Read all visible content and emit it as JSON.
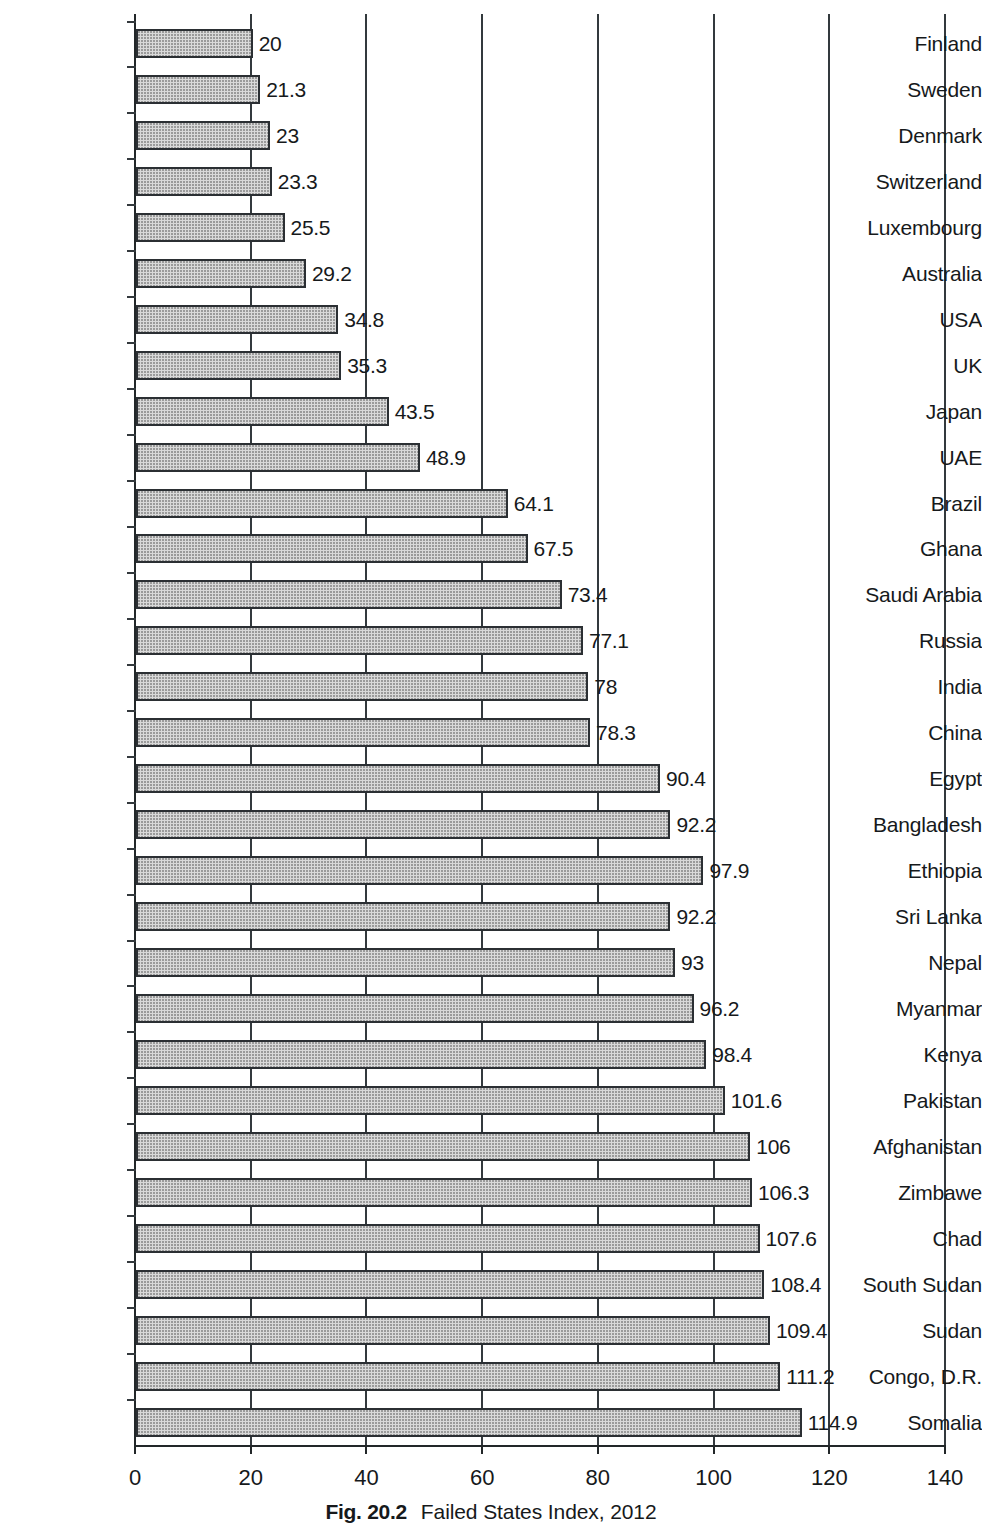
{
  "caption": {
    "figure_number": "Fig. 20.2",
    "text": "Failed States Index, 2012"
  },
  "chart_data": {
    "type": "bar",
    "orientation": "horizontal",
    "title": "Failed States Index, 2012",
    "xlabel": "",
    "ylabel": "",
    "xlim": [
      0,
      140
    ],
    "ylim": null,
    "grid": true,
    "grid_axis": "x",
    "legend": false,
    "legend_position": "none",
    "xticks": [
      0,
      20,
      40,
      60,
      80,
      100,
      120,
      140
    ],
    "xtick_labels": [
      "0",
      "20",
      "40",
      "60",
      "80",
      "100",
      "120",
      "140"
    ],
    "bar_fill_color": "#d9d9d9",
    "bar_edge_color": "#2b2f33",
    "categories": [
      "Finland",
      "Sweden",
      "Denmark",
      "Switzerland",
      "Luxembourg",
      "Australia",
      "USA",
      "UK",
      "Japan",
      "UAE",
      "Brazil",
      "Ghana",
      "Saudi Arabia",
      "Russia",
      "India",
      "China",
      "Egypt",
      "Bangladesh",
      "Ethiopia",
      "Sri Lanka",
      "Nepal",
      "Myanmar",
      "Kenya",
      "Pakistan",
      "Afghanistan",
      "Zimbawe",
      "Chad",
      "South Sudan",
      "Sudan",
      "Congo, D.R.",
      "Somalia"
    ],
    "values": [
      20,
      21.3,
      23,
      23.3,
      25.5,
      29.2,
      34.8,
      35.3,
      43.5,
      48.9,
      64.1,
      67.5,
      73.4,
      77.1,
      78,
      78.3,
      90.4,
      92.2,
      97.9,
      92.2,
      93,
      96.2,
      98.4,
      101.6,
      106,
      106.3,
      107.6,
      108.4,
      109.4,
      111.2,
      114.9
    ],
    "value_labels": [
      "20",
      "21.3",
      "23",
      "23.3",
      "25.5",
      "29.2",
      "34.8",
      "35.3",
      "43.5",
      "48.9",
      "64.1",
      "67.5",
      "73.4",
      "77.1",
      "78",
      "78.3",
      "90.4",
      "92.2",
      "97.9",
      "92.2",
      "93",
      "96.2",
      "98.4",
      "101.6",
      "106",
      "106.3",
      "107.6",
      "108.4",
      "109.4",
      "111.2",
      "114.9"
    ]
  }
}
